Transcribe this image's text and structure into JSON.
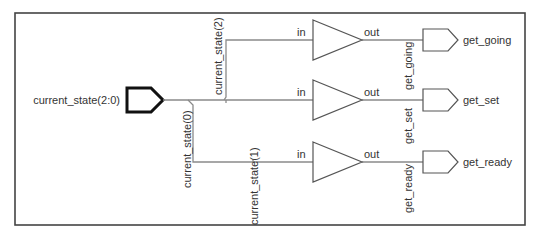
{
  "diagram": {
    "type": "rtl-schematic",
    "input_port": {
      "label": "current_state(2:0)"
    },
    "bus_taps": [
      {
        "label": "current_state(2)"
      },
      {
        "label": "current_state(1)"
      },
      {
        "label": "current_state(0)"
      }
    ],
    "buffers": [
      {
        "in_label": "in",
        "out_label": "out",
        "net_label": "get_going"
      },
      {
        "in_label": "in",
        "out_label": "out",
        "net_label": "get_set"
      },
      {
        "in_label": "in",
        "out_label": "out",
        "net_label": "get_ready"
      }
    ],
    "output_ports": [
      {
        "label": "get_going"
      },
      {
        "label": "get_set"
      },
      {
        "label": "get_ready"
      }
    ],
    "colors": {
      "frame": "#444444",
      "wire": "#8a8a8a",
      "input_port_stroke": "#111111",
      "text": "#333333",
      "background": "#ffffff"
    }
  }
}
